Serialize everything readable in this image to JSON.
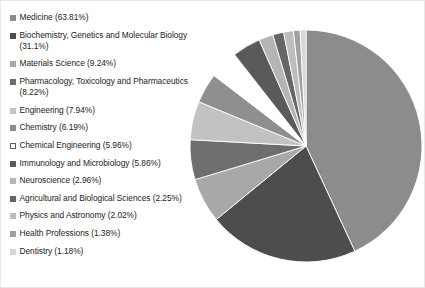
{
  "chart_data": {
    "type": "pie",
    "title": "",
    "subtitle": "",
    "xlabel": "",
    "ylabel": "",
    "grid": false,
    "legend_position": "left",
    "start_angle_deg": 0,
    "direction": "clockwise",
    "categories": [
      "Medicine",
      "Biochemistry, Genetics and Molecular Biology",
      "Materials Science",
      "Pharmacology, Toxicology and Pharmaceutics",
      "Engineering",
      "Chemistry",
      "Chemical Engineering",
      "Immunology and Microbiology",
      "Neuroscience",
      "Agricultural and Biological Sciences",
      "Physics and Astronomy",
      "Health Professions",
      "Dentistry"
    ],
    "values": [
      63.81,
      31.1,
      9.24,
      8.22,
      7.94,
      6.19,
      5.96,
      5.86,
      2.96,
      2.25,
      2.02,
      1.38,
      1.18
    ],
    "value_suffix": "%",
    "colors": [
      "#8c8c8c",
      "#4d4d4d",
      "#a8a8a8",
      "#6e6e6e",
      "#c2c2c2",
      "#8f8f8f",
      "#ffffff",
      "#5a5a5a",
      "#b5b5b5",
      "#666666",
      "#bdbdbd",
      "#a0a0a0",
      "#d6d6d6"
    ],
    "slices": [
      {
        "label": "Medicine",
        "value": 63.81,
        "display": "Medicine (63.81%)",
        "color": "#8c8c8c",
        "swatch_border": "none"
      },
      {
        "label": "Biochemistry, Genetics and Molecular Biology",
        "value": 31.1,
        "display": "Biochemistry, Genetics and Molecular Biology (31.1%)",
        "color": "#4d4d4d",
        "swatch_border": "none"
      },
      {
        "label": "Materials Science",
        "value": 9.24,
        "display": "Materials Science (9.24%)",
        "color": "#a8a8a8",
        "swatch_border": "none"
      },
      {
        "label": "Pharmacology, Toxicology and Pharmaceutics",
        "value": 8.22,
        "display": "Pharmacology, Toxicology and Pharmaceutics (8.22%)",
        "color": "#6e6e6e",
        "swatch_border": "none"
      },
      {
        "label": "Engineering",
        "value": 7.94,
        "display": "Engineering (7.94%)",
        "color": "#c2c2c2",
        "swatch_border": "none"
      },
      {
        "label": "Chemistry",
        "value": 6.19,
        "display": "Chemistry (6.19%)",
        "color": "#8f8f8f",
        "swatch_border": "none"
      },
      {
        "label": "Chemical Engineering",
        "value": 5.96,
        "display": "Chemical Engineering (5.96%)",
        "color": "#ffffff",
        "swatch_border": "#5a5a5a"
      },
      {
        "label": "Immunology and Microbiology",
        "value": 5.86,
        "display": "Immunology and Microbiology (5.86%)",
        "color": "#5a5a5a",
        "swatch_border": "none"
      },
      {
        "label": "Neuroscience",
        "value": 2.96,
        "display": "Neuroscience (2.96%)",
        "color": "#b5b5b5",
        "swatch_border": "none"
      },
      {
        "label": "Agricultural and Biological Sciences",
        "value": 2.25,
        "display": "Agricultural and Biological Sciences (2.25%)",
        "color": "#666666",
        "swatch_border": "none"
      },
      {
        "label": "Physics and Astronomy",
        "value": 2.02,
        "display": "Physics and Astronomy (2.02%)",
        "color": "#bdbdbd",
        "swatch_border": "none"
      },
      {
        "label": "Health Professions",
        "value": 1.38,
        "display": "Health Professions (1.38%)",
        "color": "#a0a0a0",
        "swatch_border": "none"
      },
      {
        "label": "Dentistry",
        "value": 1.18,
        "display": "Dentistry (1.18%)",
        "color": "#d6d6d6",
        "swatch_border": "none"
      }
    ]
  },
  "figure": {
    "background": "#ffffff",
    "pie_center_x": 117,
    "pie_center_y": 117,
    "pie_radius": 116
  }
}
